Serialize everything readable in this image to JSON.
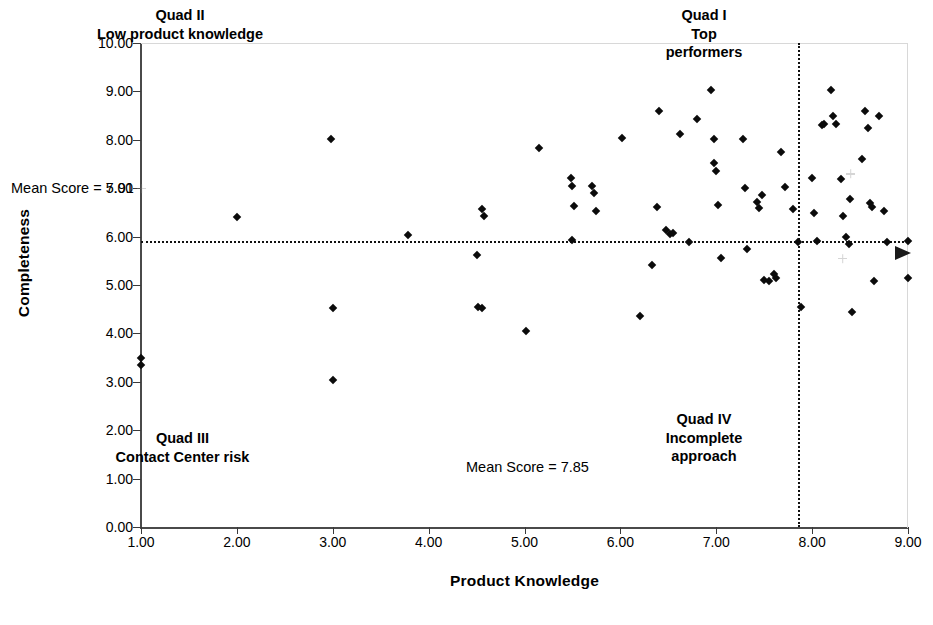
{
  "chart_data": {
    "type": "scatter",
    "title": "",
    "xlabel": "Product Knowledge",
    "ylabel": "Completeness",
    "xlim": [
      1.0,
      9.0
    ],
    "ylim": [
      0.0,
      10.0
    ],
    "grid": false,
    "legend": null,
    "x_ticks": [
      "1.00",
      "2.00",
      "3.00",
      "4.00",
      "5.00",
      "6.00",
      "7.00",
      "8.00",
      "9.00"
    ],
    "x_tick_values": [
      1,
      2,
      3,
      4,
      5,
      6,
      7,
      8,
      9
    ],
    "y_ticks": [
      "0.00",
      "1.00",
      "2.00",
      "3.00",
      "4.00",
      "5.00",
      "6.00",
      "7.00",
      "8.00",
      "9.00",
      "10.00"
    ],
    "y_tick_values": [
      0,
      1,
      2,
      3,
      4,
      5,
      6,
      7,
      8,
      9,
      10
    ],
    "reference_lines": [
      {
        "orientation": "horizontal",
        "value": 5.91,
        "label": "Mean Score = 5.91",
        "style": "dotted"
      },
      {
        "orientation": "vertical",
        "value": 7.85,
        "label": "Mean Score = 7.85",
        "style": "dotted"
      }
    ],
    "annotations": [
      {
        "id": "quad-1",
        "text": "Quad I\nTop\nperformers"
      },
      {
        "id": "quad-2",
        "text": "Quad II\nLow product knowledge"
      },
      {
        "id": "quad-3",
        "text": "Quad III\nContact Center risk"
      },
      {
        "id": "quad-4",
        "text": "Quad IV\nIncomplete\napproach"
      }
    ],
    "points": [
      [
        1.0,
        3.35
      ],
      [
        1.0,
        3.5
      ],
      [
        2.0,
        6.4
      ],
      [
        2.98,
        8.02
      ],
      [
        3.0,
        4.52
      ],
      [
        3.0,
        3.03
      ],
      [
        3.78,
        6.03
      ],
      [
        4.5,
        5.62
      ],
      [
        4.56,
        6.56
      ],
      [
        4.58,
        6.43
      ],
      [
        4.52,
        4.55
      ],
      [
        4.56,
        4.52
      ],
      [
        5.02,
        4.05
      ],
      [
        5.15,
        7.84
      ],
      [
        5.48,
        7.22
      ],
      [
        5.5,
        7.05
      ],
      [
        5.52,
        6.63
      ],
      [
        5.5,
        5.92
      ],
      [
        5.7,
        7.05
      ],
      [
        5.72,
        6.9
      ],
      [
        5.75,
        6.52
      ],
      [
        6.02,
        8.03
      ],
      [
        6.2,
        4.35
      ],
      [
        6.33,
        5.42
      ],
      [
        6.38,
        6.62
      ],
      [
        6.4,
        8.6
      ],
      [
        6.48,
        6.13
      ],
      [
        6.52,
        6.05
      ],
      [
        6.55,
        6.08
      ],
      [
        6.62,
        8.12
      ],
      [
        6.72,
        5.88
      ],
      [
        6.8,
        8.42
      ],
      [
        6.95,
        9.02
      ],
      [
        6.98,
        8.02
      ],
      [
        6.98,
        7.52
      ],
      [
        7.0,
        7.35
      ],
      [
        7.02,
        6.65
      ],
      [
        7.05,
        5.55
      ],
      [
        7.28,
        8.02
      ],
      [
        7.3,
        7.0
      ],
      [
        7.32,
        5.75
      ],
      [
        7.42,
        6.72
      ],
      [
        7.45,
        6.6
      ],
      [
        7.48,
        6.85
      ],
      [
        7.5,
        5.1
      ],
      [
        7.55,
        5.08
      ],
      [
        7.6,
        5.22
      ],
      [
        7.62,
        5.15
      ],
      [
        7.68,
        7.75
      ],
      [
        7.72,
        7.02
      ],
      [
        7.8,
        6.58
      ],
      [
        7.85,
        5.88
      ],
      [
        7.88,
        4.55
      ],
      [
        8.0,
        7.22
      ],
      [
        8.02,
        6.48
      ],
      [
        8.05,
        5.9
      ],
      [
        8.1,
        8.3
      ],
      [
        8.12,
        8.32
      ],
      [
        8.2,
        9.02
      ],
      [
        8.22,
        8.5
      ],
      [
        8.25,
        8.32
      ],
      [
        8.3,
        7.18
      ],
      [
        8.32,
        6.42
      ],
      [
        8.35,
        6.0
      ],
      [
        8.38,
        5.85
      ],
      [
        8.4,
        6.78
      ],
      [
        8.42,
        4.45
      ],
      [
        8.52,
        7.6
      ],
      [
        8.55,
        8.6
      ],
      [
        8.58,
        8.25
      ],
      [
        8.6,
        6.7
      ],
      [
        8.62,
        6.62
      ],
      [
        8.65,
        5.08
      ],
      [
        8.7,
        8.5
      ],
      [
        8.75,
        6.52
      ],
      [
        8.78,
        5.88
      ],
      [
        9.0,
        5.15
      ],
      [
        9.0,
        5.9
      ]
    ],
    "faint_points": [
      [
        1.0,
        7.0
      ],
      [
        8.4,
        7.3
      ],
      [
        8.32,
        5.55
      ]
    ],
    "marker": {
      "shape": "diamond",
      "color": "#0b0b0b",
      "size": 6
    }
  }
}
